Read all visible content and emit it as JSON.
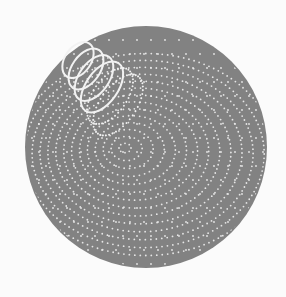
{
  "canvas": {
    "width": 286,
    "height": 297,
    "background": "#fbfbfb"
  },
  "disc": {
    "cx": 146,
    "cy": 147,
    "r": 121,
    "fill": "#828282"
  },
  "colors": {
    "dot": "#e6e6e6",
    "coil": "#f2f2f2"
  },
  "focal_point": {
    "x": 125,
    "y": 148
  },
  "rings": {
    "count": 14,
    "start_radius": 6,
    "spacing": 9.5,
    "dot_spacing": 5.5,
    "dot_radius": 0.9,
    "squash_y": 0.78,
    "center_drift_x": 1.6,
    "center_drift_y": 0.5
  },
  "field_dots": {
    "spacing": 14,
    "dot_radius": 0.9
  },
  "coil": {
    "loops": 6,
    "start": {
      "x": 78,
      "y": 60
    },
    "end": {
      "x": 118,
      "y": 105
    },
    "loop_rx": [
      13,
      14,
      15,
      16,
      17,
      18
    ],
    "loop_ry": [
      20,
      23,
      26,
      29,
      32,
      35
    ],
    "rotation_deg": 35,
    "solid_loops": 4,
    "stroke_width": 2
  }
}
